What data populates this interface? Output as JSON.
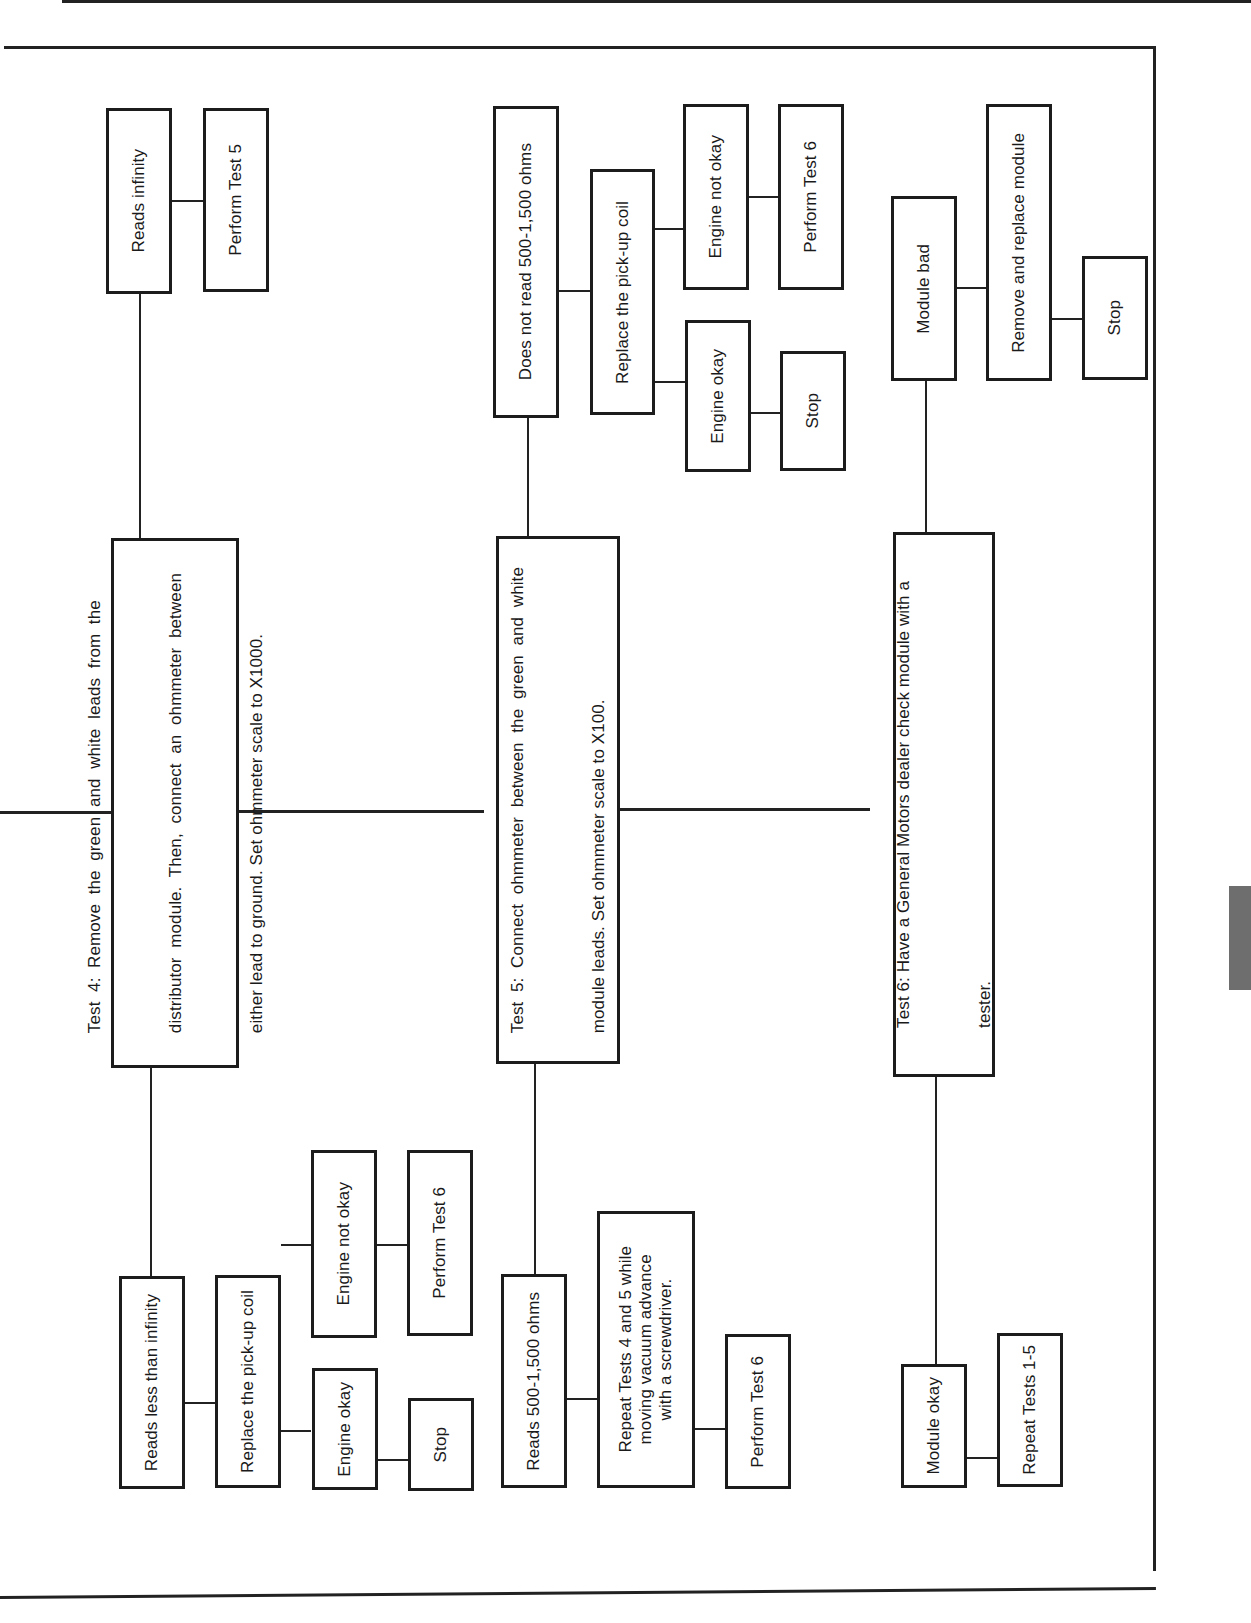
{
  "diagram": {
    "orientation": "rotated-90-ccw",
    "tests": [
      {
        "id": "test4",
        "text": "Test 4: Remove the green and white leads from the distributor module. Then, connect an ohmmeter between either lead to ground. Set ohmmeter scale to X1000.",
        "lines": [
          "Test  4:  Remove  the  green  and  white  leads  from  the",
          "distributor  module.  Then,  connect  an  ohmmeter  between",
          "either lead to ground. Set ohmmeter scale to X1000."
        ],
        "branch_left": {
          "label": "Reads less than infinity",
          "action": "Replace the pick-up coil",
          "outcomes": [
            {
              "label": "Engine okay",
              "next": "Stop"
            },
            {
              "label": "Engine not okay",
              "next": "Perform Test 6"
            }
          ]
        },
        "branch_right": {
          "label": "Reads infinity",
          "next": "Perform Test 5"
        }
      },
      {
        "id": "test5",
        "text": "Test 5: Connect ohmmeter between the green and white module leads. Set ohmmeter scale to X100.",
        "lines": [
          "Test  5:  Connect  ohmmeter  between  the  green  and  white",
          "module leads. Set ohmmeter scale to X100."
        ],
        "branch_left": {
          "label": "Reads 500-1,500 ohms",
          "action_lines": [
            "Repeat Tests 4 and 5 while",
            "moving vacuum advance",
            "with a screwdriver."
          ],
          "next": "Perform Test 6"
        },
        "branch_right": {
          "label": "Does not read 500-1,500 ohms",
          "action": "Replace the pick-up coil",
          "outcomes": [
            {
              "label": "Engine okay",
              "next": "Stop"
            },
            {
              "label": "Engine not okay",
              "next": "Perform Test 6"
            }
          ]
        }
      },
      {
        "id": "test6",
        "text": "Test 6: Have a General Motors dealer check module with a tester.",
        "lines": [
          "Test 6: Have a General Motors dealer check module with a",
          "tester."
        ],
        "branch_left": {
          "label": "Module okay",
          "next": "Repeat Tests 1-5"
        },
        "branch_right": {
          "label": "Module bad",
          "action": "Remove and replace module",
          "next": "Stop"
        }
      }
    ],
    "colors": {
      "line": "#222222",
      "box_border": "#1c1c1c",
      "thumb_tab": "#6e6e6e",
      "background": "#ffffff"
    }
  }
}
